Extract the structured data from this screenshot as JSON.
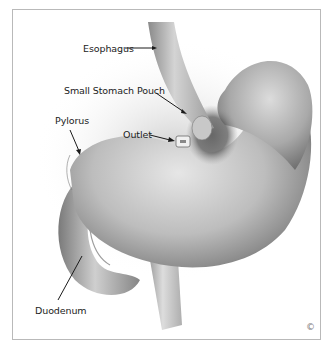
{
  "figure": {
    "labels": {
      "esophagus": "Esophagus",
      "small_stomach_pouch": "Small Stomach Pouch",
      "outlet": "Outlet",
      "pylorus": "Pylorus",
      "duodenum": "Duodenum"
    },
    "copyright": "©"
  }
}
